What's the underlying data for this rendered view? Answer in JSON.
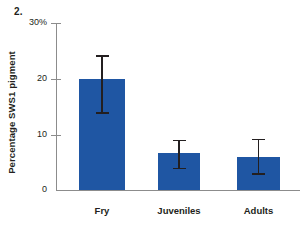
{
  "figure": {
    "number_label": "2."
  },
  "chart_data": {
    "type": "bar",
    "title": "",
    "subtitle": "",
    "xlabel": "",
    "ylabel": "Percentage SWS1 pigment",
    "categories": [
      "Fry",
      "Juveniles",
      "Adults"
    ],
    "values": [
      20.0,
      6.6,
      5.9
    ],
    "errors_low": [
      14.0,
      4.0,
      3.0
    ],
    "errors_high": [
      24.2,
      9.0,
      9.2
    ],
    "error_minus": [
      6.0,
      2.6,
      2.9
    ],
    "error_plus": [
      4.2,
      2.4,
      3.3
    ],
    "ylim": [
      0,
      30
    ],
    "yticks": [
      0,
      10,
      20,
      30
    ],
    "ytick_labels": [
      "0",
      "10",
      "20",
      "30%"
    ],
    "grid": false,
    "legend": false,
    "legend_position": "none",
    "bar_color": "#1f56a3",
    "error_color": "#231f20",
    "axis_color": "#8c8c8c",
    "background": "#ffffff"
  }
}
